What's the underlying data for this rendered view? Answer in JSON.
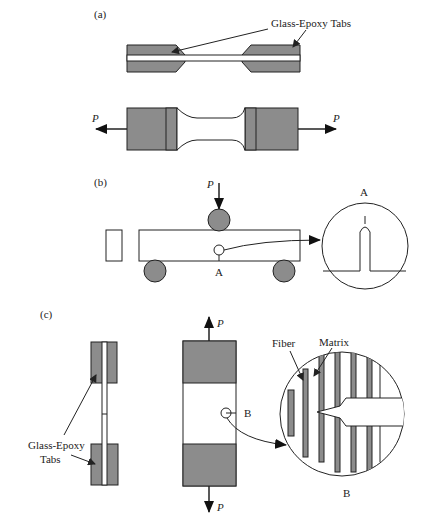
{
  "panels": {
    "a": {
      "label": "(a)",
      "callout": "Glass-Epoxy Tabs",
      "load_left": "P",
      "load_right": "P"
    },
    "b": {
      "label": "(b)",
      "load": "P",
      "notch_point": "A",
      "detail_label": "A"
    },
    "c": {
      "label": "(c)",
      "callout_line1": "Glass-Epoxy",
      "callout_line2": "Tabs",
      "load_top": "P",
      "load_bottom": "P",
      "point": "B",
      "fiber_label": "Fiber",
      "matrix_label": "Matrix",
      "detail_label": "B"
    }
  },
  "colors": {
    "tab_fill": "#8c8c8c",
    "stroke": "#222222"
  }
}
